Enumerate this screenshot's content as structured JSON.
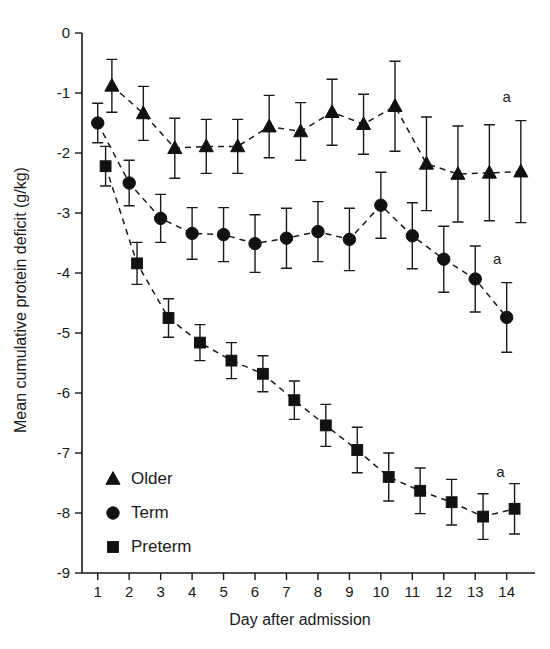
{
  "chart_data": {
    "type": "line",
    "title": "",
    "xlabel": "Day after admission",
    "ylabel": "Mean cumulative protein deficit (g/kg)",
    "x": [
      1,
      2,
      3,
      4,
      5,
      6,
      7,
      8,
      9,
      10,
      11,
      12,
      13,
      14
    ],
    "xlim": [
      0.5,
      14.9
    ],
    "ylim": [
      -9,
      0
    ],
    "xticks": [
      1,
      2,
      3,
      4,
      5,
      6,
      7,
      8,
      9,
      10,
      11,
      12,
      13,
      14
    ],
    "xtick_labels": [
      "1",
      "2",
      "3",
      "4",
      "5",
      "6",
      "7",
      "8",
      "9",
      "10",
      "11",
      "12",
      "13",
      "14"
    ],
    "yticks": [
      0,
      -1,
      -2,
      -3,
      -4,
      -5,
      -6,
      -7,
      -8,
      -9
    ],
    "ytick_labels": [
      "0",
      "-1",
      "-2",
      "-3",
      "-4",
      "-5",
      "-6",
      "-7",
      "-8",
      "-9"
    ],
    "grid": false,
    "legend_position": "lower-left-inside",
    "errorbar_type": "symmetric",
    "series": [
      {
        "name": "Older",
        "marker": "triangle",
        "x_offset": 0.45,
        "values": [
          -0.88,
          -1.34,
          -1.92,
          -1.89,
          -1.89,
          -1.56,
          -1.64,
          -1.32,
          -1.52,
          -1.22,
          -2.18,
          -2.35,
          -2.33,
          -2.31
        ],
        "errors": [
          0.44,
          0.45,
          0.5,
          0.45,
          0.45,
          0.52,
          0.48,
          0.55,
          0.5,
          0.75,
          0.78,
          0.8,
          0.8,
          0.85
        ],
        "annotation": "a"
      },
      {
        "name": "Term",
        "marker": "circle",
        "x_offset": 0,
        "values": [
          -1.5,
          -2.5,
          -3.09,
          -3.34,
          -3.36,
          -3.51,
          -3.42,
          -3.31,
          -3.44,
          -2.87,
          -3.38,
          -3.77,
          -4.1,
          -4.74
        ],
        "errors": [
          0.33,
          0.38,
          0.4,
          0.43,
          0.45,
          0.48,
          0.5,
          0.5,
          0.52,
          0.55,
          0.55,
          0.55,
          0.55,
          0.58
        ],
        "annotation": "a"
      },
      {
        "name": "Preterm",
        "marker": "square",
        "x_offset": 0.25,
        "values": [
          -2.22,
          -3.84,
          -4.75,
          -5.16,
          -5.46,
          -5.68,
          -6.12,
          -6.54,
          -6.95,
          -7.4,
          -7.63,
          -7.82,
          -8.06,
          -7.93
        ],
        "errors": [
          0.33,
          0.35,
          0.32,
          0.3,
          0.3,
          0.3,
          0.32,
          0.35,
          0.38,
          0.4,
          0.38,
          0.38,
          0.38,
          0.42
        ],
        "annotation": "a"
      }
    ],
    "annotations": [
      {
        "text": "a",
        "series": "Older",
        "near_x": 14,
        "near_y": -1.15
      },
      {
        "text": "a",
        "series": "Term",
        "near_x": 13.7,
        "near_y": -3.85
      },
      {
        "text": "a",
        "series": "Preterm",
        "near_x": 13.8,
        "near_y": -7.4
      }
    ]
  },
  "legend": {
    "items": [
      {
        "label": "Older",
        "marker": "triangle"
      },
      {
        "label": "Term",
        "marker": "circle"
      },
      {
        "label": "Preterm",
        "marker": "square"
      }
    ]
  }
}
